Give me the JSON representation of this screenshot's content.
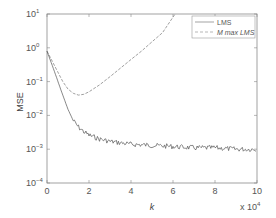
{
  "chart_data": {
    "type": "line",
    "title": "",
    "xlabel": "k",
    "x_multiplier": "x 10^4",
    "ylabel": "MSE",
    "yscale": "log",
    "xlim": [
      0,
      10
    ],
    "ylim": [
      0.0001,
      10
    ],
    "x_ticks": [
      "0",
      "2",
      "4",
      "6",
      "8",
      "10"
    ],
    "y_ticks": [
      "10^1",
      "10^0",
      "10^-1",
      "10^-2",
      "10^-3",
      "10^-4"
    ],
    "grid": false,
    "legend_position": "upper right",
    "series": [
      {
        "name": "LMS",
        "style": "solid",
        "x": [
          0,
          0.25,
          0.5,
          0.75,
          1.0,
          1.25,
          1.5,
          1.75,
          2.0,
          2.5,
          3.0,
          4.0,
          5.0,
          6.0,
          7.0,
          8.0,
          9.0,
          10.0
        ],
        "y": [
          0.8,
          0.3,
          0.11,
          0.04,
          0.015,
          0.007,
          0.0045,
          0.0033,
          0.0026,
          0.002,
          0.0017,
          0.0014,
          0.0013,
          0.0012,
          0.0011,
          0.0011,
          0.001,
          0.001
        ]
      },
      {
        "name": "M max LMS",
        "style": "dashed",
        "x": [
          0,
          0.25,
          0.5,
          0.75,
          1.0,
          1.25,
          1.5,
          1.75,
          2.0,
          2.5,
          3.0,
          3.5,
          4.0,
          4.5,
          5.0,
          5.5,
          6.1
        ],
        "y": [
          0.8,
          0.4,
          0.2,
          0.1,
          0.06,
          0.045,
          0.04,
          0.042,
          0.05,
          0.08,
          0.14,
          0.25,
          0.45,
          0.8,
          1.5,
          2.8,
          10
        ]
      }
    ]
  },
  "axes": {
    "xlabel": "k",
    "x_multiplier": "x 10",
    "x_multiplier_exp": "4",
    "ylabel": "MSE",
    "x_ticks": [
      "0",
      "2",
      "4",
      "6",
      "8",
      "10"
    ],
    "y_ticks": [
      {
        "base": "10",
        "exp": "1"
      },
      {
        "base": "10",
        "exp": "0"
      },
      {
        "base": "10",
        "exp": "−1"
      },
      {
        "base": "10",
        "exp": "−2"
      },
      {
        "base": "10",
        "exp": "−3"
      },
      {
        "base": "10",
        "exp": "−4"
      }
    ]
  },
  "legend": {
    "items": [
      {
        "label": "LMS",
        "style": "solid"
      },
      {
        "label": "M max LMS",
        "style": "dashed"
      }
    ]
  },
  "colors": {
    "axis": "#888888",
    "lms": "#555555",
    "mmax": "#888888"
  }
}
